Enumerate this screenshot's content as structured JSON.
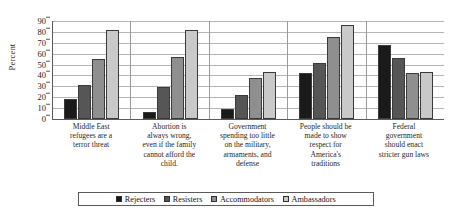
{
  "chart_data": {
    "type": "bar",
    "title": "",
    "xlabel": "",
    "ylabel": "Percent",
    "ylim": [
      0,
      90
    ],
    "ytick_step": 10,
    "yticks": [
      0,
      10,
      20,
      30,
      40,
      50,
      60,
      70,
      80,
      90
    ],
    "grid": true,
    "legend_position": "bottom",
    "categories": [
      "Middle East refugees are a terror threat",
      "Abortion is always wrong, even if the family cannot afford the child.",
      "Government spending too little on the military, armaments, and defense",
      "People should be made to show respect for America's traditions",
      "Federal government should enact stricter gun laws"
    ],
    "series": [
      {
        "name": "Rejecters",
        "color": "#1a1a1a",
        "values": [
          18,
          6,
          9,
          42,
          68
        ]
      },
      {
        "name": "Resisters",
        "color": "#565656",
        "values": [
          31,
          29,
          22,
          51,
          56
        ]
      },
      {
        "name": "Accommodators",
        "color": "#8f8f8f",
        "values": [
          55,
          57,
          38,
          75,
          42
        ]
      },
      {
        "name": "Ambassadors",
        "color": "#c9c9c9",
        "values": [
          82,
          82,
          43,
          86,
          43
        ]
      }
    ]
  },
  "axis": {
    "y_title": "Percent"
  },
  "category_lines": [
    [
      "Middle East",
      "refugees are a",
      "terror threat"
    ],
    [
      "Abortion is",
      "always wrong,",
      "even if the family",
      "cannot afford the",
      "child."
    ],
    [
      "Government",
      "spending too little",
      "on the military,",
      "armaments, and",
      "defense"
    ],
    [
      "People should be",
      "made to show",
      "respect for",
      "America's",
      "traditions"
    ],
    [
      "Federal",
      "government",
      "should enact",
      "stricter gun laws"
    ]
  ]
}
